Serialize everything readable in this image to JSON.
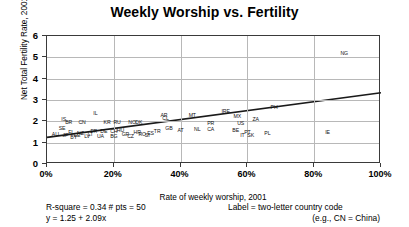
{
  "chart_data": {
    "type": "scatter",
    "title": "Weekly Worship vs. Fertility",
    "xlabel": "Rate of weekly worship, 2001",
    "ylabel": "Net Total Fertility Rate, 2001",
    "xlim": [
      0,
      100
    ],
    "ylim": [
      0,
      6
    ],
    "xticks": [
      "0%",
      "20%",
      "40%",
      "60%",
      "80%",
      "100%"
    ],
    "xtickvalues": [
      0,
      20,
      40,
      60,
      80,
      100
    ],
    "yticks": [
      "0",
      "1",
      "2",
      "3",
      "4",
      "5",
      "6"
    ],
    "ytickvalues": [
      0,
      1,
      2,
      3,
      4,
      5,
      6
    ],
    "grid": true,
    "legend": "none",
    "point_label_type": "two-letter country code",
    "points": [
      {
        "label": "NG",
        "x": 89.0,
        "y": 5.15
      },
      {
        "label": "PH",
        "x": 68.0,
        "y": 2.62
      },
      {
        "label": "IE",
        "x": 84.0,
        "y": 1.45
      },
      {
        "label": "IL",
        "x": 14.5,
        "y": 2.33
      },
      {
        "label": "MX",
        "x": 57.0,
        "y": 2.22
      },
      {
        "label": "IRE",
        "x": 53.5,
        "y": 2.45
      },
      {
        "label": "ZA",
        "x": 62.5,
        "y": 2.05
      },
      {
        "label": "US",
        "x": 58.0,
        "y": 1.88
      },
      {
        "label": "AR",
        "x": 35.0,
        "y": 2.25
      },
      {
        "label": "CL",
        "x": 35.5,
        "y": 2.1
      },
      {
        "label": "MT",
        "x": 43.5,
        "y": 2.25
      },
      {
        "label": "PR",
        "x": 49.0,
        "y": 1.88
      },
      {
        "label": "PL",
        "x": 66.0,
        "y": 1.42
      },
      {
        "label": "NL",
        "x": 45.0,
        "y": 1.6
      },
      {
        "label": "CA",
        "x": 49.0,
        "y": 1.58
      },
      {
        "label": "BE",
        "x": 56.5,
        "y": 1.55
      },
      {
        "label": "PT",
        "x": 60.0,
        "y": 1.47
      },
      {
        "label": "IT",
        "x": 58.5,
        "y": 1.33
      },
      {
        "label": "SK",
        "x": 61.0,
        "y": 1.31
      },
      {
        "label": "GB",
        "x": 36.5,
        "y": 1.62
      },
      {
        "label": "AT",
        "x": 40.0,
        "y": 1.53
      },
      {
        "label": "ES",
        "x": 31.0,
        "y": 1.4
      },
      {
        "label": "CN",
        "x": 10.5,
        "y": 1.92
      },
      {
        "label": "KR",
        "x": 18.0,
        "y": 1.9
      },
      {
        "label": "RU",
        "x": 21.0,
        "y": 1.9
      },
      {
        "label": "BR",
        "x": 6.5,
        "y": 1.93
      },
      {
        "label": "IS",
        "x": 5.0,
        "y": 2.05
      },
      {
        "label": "NO",
        "x": 25.5,
        "y": 1.92
      },
      {
        "label": "DK",
        "x": 27.5,
        "y": 1.9
      },
      {
        "label": "HU",
        "x": 22.0,
        "y": 1.55
      },
      {
        "label": "DE",
        "x": 17.0,
        "y": 1.52
      },
      {
        "label": "CH",
        "x": 20.0,
        "y": 1.5
      },
      {
        "label": "FR",
        "x": 14.0,
        "y": 1.48
      },
      {
        "label": "SE",
        "x": 4.5,
        "y": 1.62
      },
      {
        "label": "FI",
        "x": 7.0,
        "y": 1.45
      },
      {
        "label": "NZ",
        "x": 10.0,
        "y": 1.4
      },
      {
        "label": "AU",
        "x": 2.5,
        "y": 1.38
      },
      {
        "label": "JP",
        "x": 5.5,
        "y": 1.32
      },
      {
        "label": "EE",
        "x": 9.0,
        "y": 1.3
      },
      {
        "label": "LV",
        "x": 12.0,
        "y": 1.28
      },
      {
        "label": "BG",
        "x": 20.0,
        "y": 1.28
      },
      {
        "label": "CZ",
        "x": 25.0,
        "y": 1.27
      },
      {
        "label": "UA",
        "x": 16.0,
        "y": 1.26
      },
      {
        "label": "RO",
        "x": 28.5,
        "y": 1.35
      },
      {
        "label": "SI",
        "x": 30.0,
        "y": 1.33
      },
      {
        "label": "GR",
        "x": 23.5,
        "y": 1.38
      },
      {
        "label": "HR",
        "x": 27.0,
        "y": 1.45
      },
      {
        "label": "LT",
        "x": 13.0,
        "y": 1.35
      },
      {
        "label": "BY",
        "x": 8.0,
        "y": 1.23
      },
      {
        "label": "TR",
        "x": 33.0,
        "y": 1.5
      }
    ],
    "fit": {
      "equation": "y = 1.25 + 2.09x",
      "intercept": 1.25,
      "slope": 2.09,
      "r_square": 0.34,
      "n_points": 50,
      "x_start": 0,
      "y_start": 1.25,
      "x_end": 100,
      "y_end": 3.34
    }
  },
  "footer": {
    "stats": "R-square = 0.34   # pts = 50",
    "equation": "y = 1.25 + 2.09x",
    "legend_note": "Label = two-letter country code",
    "legend_example": "(e.g.,  CN = China)"
  }
}
